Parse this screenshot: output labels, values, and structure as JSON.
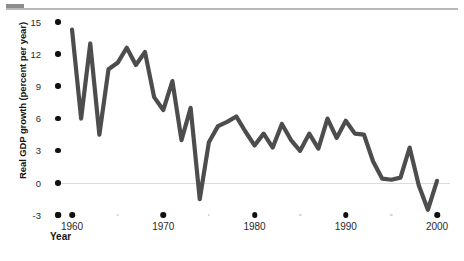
{
  "chart_data": {
    "type": "line",
    "title": "",
    "xlabel": "Year",
    "ylabel": "Real GDP growth (percent per year)",
    "xlim": [
      1959,
      2001
    ],
    "ylim": [
      -3,
      15
    ],
    "grid": false,
    "legend": null,
    "zero_line": 0,
    "line_color": "#4d4d4d",
    "line_width": 4.2,
    "y_ticks": [
      15,
      12,
      9,
      6,
      3,
      0,
      -3
    ],
    "y_tick_labels": [
      "15",
      "12",
      "9",
      "6",
      "3",
      "0",
      "-3"
    ],
    "x_ticks_major": [
      1960,
      1970,
      1980,
      1990,
      2000
    ],
    "x_tick_labels": [
      "1960",
      "1970",
      "1980",
      "1990",
      "2000"
    ],
    "x_ticks_minor": [
      1965,
      1975,
      1985,
      1995
    ],
    "series": [
      {
        "name": "Real GDP growth",
        "x": [
          1960,
          1961,
          1962,
          1963,
          1964,
          1965,
          1966,
          1967,
          1968,
          1969,
          1970,
          1971,
          1972,
          1973,
          1974,
          1975,
          1976,
          1977,
          1978,
          1979,
          1980,
          1981,
          1982,
          1983,
          1984,
          1985,
          1986,
          1987,
          1988,
          1989,
          1990,
          1991,
          1992,
          1993,
          1994,
          1995,
          1996,
          1997,
          1998,
          1999,
          2000
        ],
        "y": [
          14.3,
          6.0,
          13.0,
          4.5,
          10.6,
          11.2,
          12.6,
          11.0,
          12.2,
          8.0,
          6.8,
          9.5,
          4.0,
          7.0,
          -1.5,
          3.8,
          5.3,
          5.7,
          6.2,
          4.8,
          3.5,
          4.6,
          3.3,
          5.5,
          4.0,
          3.0,
          4.6,
          3.2,
          6.0,
          4.2,
          5.8,
          4.6,
          4.5,
          2.0,
          0.4,
          0.3,
          0.5,
          3.3,
          -0.2,
          -2.5,
          0.2
        ]
      }
    ]
  },
  "axis": {
    "y_title": "Real GDP growth (percent per year)",
    "x_title": "Year"
  }
}
